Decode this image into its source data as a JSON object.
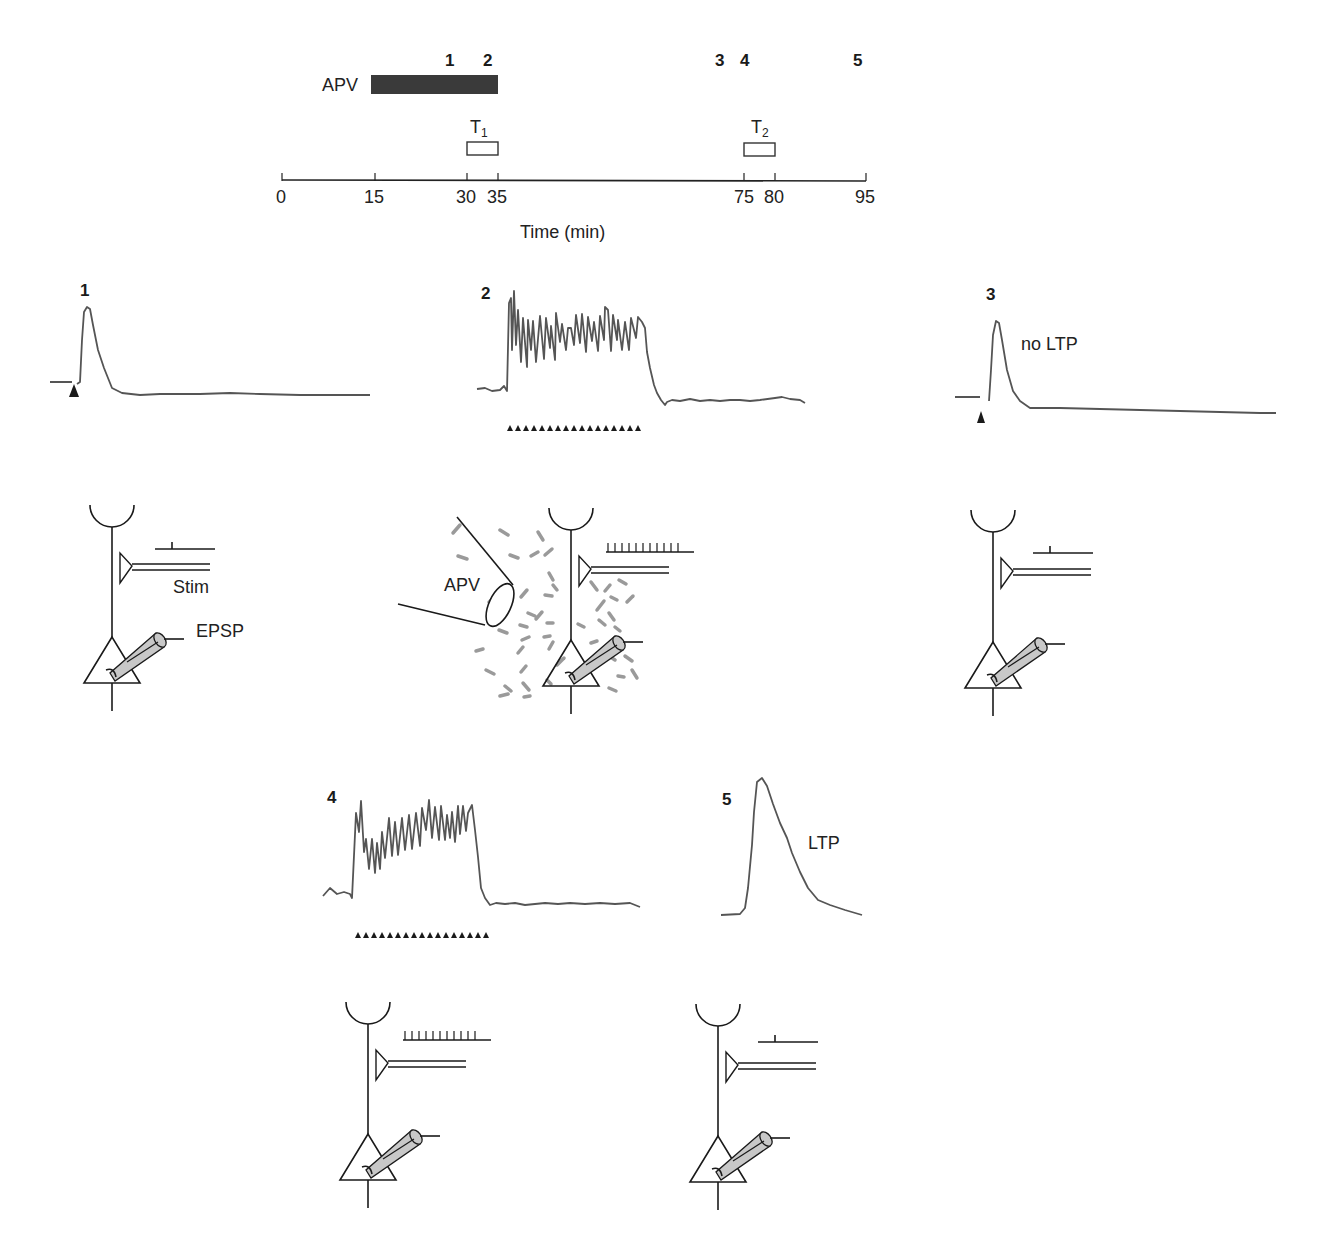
{
  "timeline": {
    "drug_label": "APV",
    "drug_bar": {
      "start_min": 15,
      "end_min": 35,
      "color": "#3a3a3a"
    },
    "sample_markers": [
      {
        "label": "1",
        "time_min": 27
      },
      {
        "label": "2",
        "time_min": 33
      },
      {
        "label": "3",
        "time_min": 71
      },
      {
        "label": "4",
        "time_min": 76
      },
      {
        "label": "5",
        "time_min": 94
      }
    ],
    "tetanus": [
      {
        "label": "T",
        "subscript": "1",
        "start_min": 30,
        "end_min": 35
      },
      {
        "label": "T",
        "subscript": "2",
        "start_min": 75,
        "end_min": 80
      }
    ],
    "ticks": [
      "0",
      "15",
      "30",
      "35",
      "75",
      "80",
      "95"
    ],
    "axis_label": "Time (min)"
  },
  "panels": [
    {
      "id": "1",
      "number": "1",
      "trace": "single-epsp",
      "annotation": "",
      "stim": "single",
      "electrode_labels": {
        "stim": "Stim",
        "record": "EPSP"
      },
      "drug": ""
    },
    {
      "id": "2",
      "number": "2",
      "trace": "tetanus",
      "annotation": "",
      "stim": "train",
      "drug": "APV"
    },
    {
      "id": "3",
      "number": "3",
      "trace": "single-epsp",
      "annotation": "no LTP",
      "stim": "single",
      "drug": ""
    },
    {
      "id": "4",
      "number": "4",
      "trace": "tetanus",
      "annotation": "",
      "stim": "train",
      "drug": ""
    },
    {
      "id": "5",
      "number": "5",
      "trace": "potentiated-epsp",
      "annotation": "LTP",
      "stim": "single",
      "drug": ""
    }
  ],
  "colors": {
    "trace": "#555555",
    "ink": "#1a1a1a",
    "apv_particles": "#9a9a9a",
    "electrode_fill": "#c8c8c8"
  }
}
